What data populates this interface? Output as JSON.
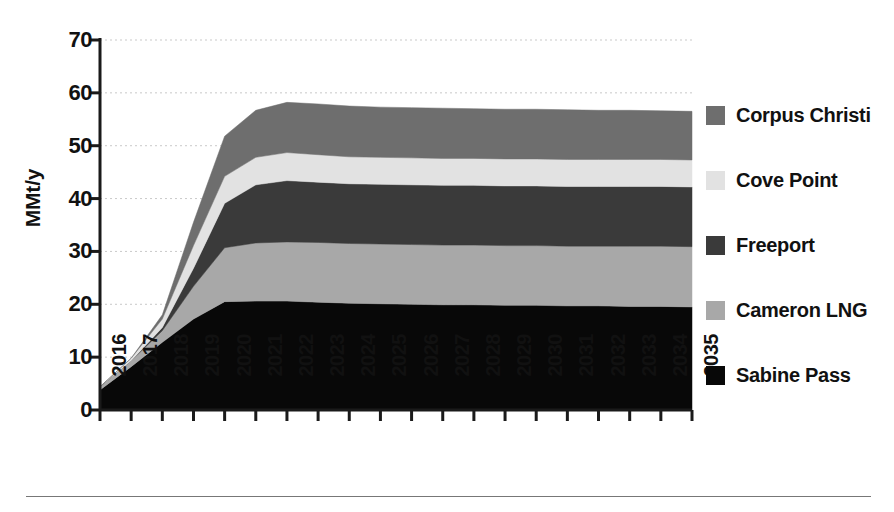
{
  "chart_data": {
    "type": "area",
    "stacked": true,
    "title": "",
    "subtitle": "",
    "xlabel": "",
    "ylabel": "MMt/y",
    "xlim": [
      2016,
      2035
    ],
    "ylim": [
      0,
      70
    ],
    "yticks": [
      0,
      10,
      20,
      30,
      40,
      50,
      60,
      70
    ],
    "ytick_labels": [
      "0",
      "10",
      "20",
      "30",
      "40",
      "50",
      "60",
      "70"
    ],
    "grid": true,
    "grid_axis": "y",
    "grid_style": "dotted",
    "legend_position": "right",
    "categories": [
      "2016",
      "2017",
      "2018",
      "2019",
      "2020",
      "2021",
      "2022",
      "2023",
      "2024",
      "2025",
      "2026",
      "2027",
      "2028",
      "2029",
      "2030",
      "2031",
      "2032",
      "2033",
      "2034",
      "2035"
    ],
    "x": [
      2016,
      2017,
      2018,
      2019,
      2020,
      2021,
      2022,
      2023,
      2024,
      2025,
      2026,
      2027,
      2028,
      2029,
      2030,
      2031,
      2032,
      2033,
      2034,
      2035
    ],
    "series": [
      {
        "name": "Sabine Pass",
        "color": "#080808",
        "stack_order": 1,
        "values": [
          3.8,
          8.2,
          12.8,
          17.2,
          20.5,
          20.6,
          20.6,
          20.4,
          20.2,
          20.1,
          20.0,
          19.9,
          19.9,
          19.8,
          19.8,
          19.7,
          19.7,
          19.6,
          19.6,
          19.5
        ]
      },
      {
        "name": "Cameron LNG",
        "color": "#a8a8a8",
        "stack_order": 2,
        "values": [
          0.6,
          1.1,
          2.2,
          6.2,
          10.2,
          11.0,
          11.2,
          11.3,
          11.3,
          11.3,
          11.3,
          11.3,
          11.3,
          11.3,
          11.3,
          11.3,
          11.3,
          11.4,
          11.4,
          11.4
        ]
      },
      {
        "name": "Freeport",
        "color": "#3a3a3a",
        "stack_order": 3,
        "values": [
          0.0,
          0.0,
          0.6,
          3.4,
          8.4,
          11.0,
          11.6,
          11.4,
          11.3,
          11.3,
          11.3,
          11.3,
          11.3,
          11.3,
          11.3,
          11.3,
          11.3,
          11.3,
          11.3,
          11.3
        ]
      },
      {
        "name": "Cove Point",
        "color": "#e2e2e2",
        "stack_order": 4,
        "values": [
          0.0,
          0.5,
          1.6,
          4.3,
          5.1,
          5.2,
          5.3,
          5.2,
          5.1,
          5.1,
          5.1,
          5.1,
          5.1,
          5.1,
          5.1,
          5.1,
          5.1,
          5.1,
          5.1,
          5.1
        ]
      },
      {
        "name": "Corpus Christi",
        "color": "#6e6e6e",
        "stack_order": 5,
        "values": [
          0.0,
          0.0,
          0.8,
          4.4,
          7.6,
          8.9,
          9.5,
          9.6,
          9.6,
          9.5,
          9.5,
          9.5,
          9.4,
          9.4,
          9.4,
          9.4,
          9.3,
          9.3,
          9.2,
          9.2
        ]
      }
    ],
    "stack_totals": [
      4.4,
      9.8,
      18.0,
      35.5,
      51.8,
      56.7,
      58.2,
      57.9,
      57.5,
      57.3,
      57.2,
      57.1,
      57.0,
      56.9,
      56.9,
      56.8,
      56.7,
      56.7,
      56.6,
      56.5
    ]
  },
  "legend": {
    "items": [
      {
        "label": "Corpus Christi",
        "color": "#6e6e6e"
      },
      {
        "label": "Cove Point",
        "color": "#e2e2e2"
      },
      {
        "label": "Freeport",
        "color": "#3a3a3a"
      },
      {
        "label": "Cameron LNG",
        "color": "#a8a8a8"
      },
      {
        "label": "Sabine Pass",
        "color": "#080808"
      }
    ]
  },
  "axes": {
    "y_title": "MMt/y",
    "y_tick_labels": [
      "70",
      "60",
      "50",
      "40",
      "30",
      "20",
      "10",
      "0"
    ],
    "x_tick_labels": [
      "2016",
      "2017",
      "2018",
      "2019",
      "2020",
      "2021",
      "2022",
      "2023",
      "2024",
      "2025",
      "2026",
      "2027",
      "2028",
      "2029",
      "2030",
      "2031",
      "2032",
      "2033",
      "2034",
      "2035"
    ]
  },
  "colors": {
    "axis": "#1a1a1a",
    "grid": "#c9c9c9",
    "rule": "#777777",
    "background": "#ffffff"
  }
}
